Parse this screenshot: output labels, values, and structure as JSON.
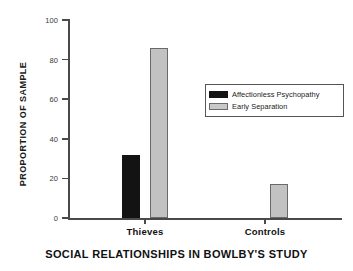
{
  "chart_data": {
    "type": "bar",
    "title": "SOCIAL RELATIONSHIPS IN BOWLBY'S STUDY",
    "xlabel": "",
    "ylabel": "PROPORTION OF SAMPLE",
    "categories": [
      "Thieves",
      "Controls"
    ],
    "series": [
      {
        "name": "Affectionless Psychopathy",
        "color": "#131313",
        "values": [
          32,
          0
        ]
      },
      {
        "name": "Early Separation",
        "color": "#c2c2c2",
        "values": [
          86,
          17
        ]
      }
    ],
    "ylim": [
      0,
      100
    ],
    "yticks": [
      0,
      20,
      40,
      60,
      80,
      100
    ],
    "ytick_labels": [
      "0",
      "20",
      "40",
      "60",
      "80",
      "100"
    ],
    "grid": false,
    "legend_position": "upper right"
  },
  "legend": {
    "items": [
      {
        "label": "Affectionless Psychopathy",
        "swatch": "dark-swatch"
      },
      {
        "label": "Early Separation",
        "swatch": "light-swatch"
      }
    ]
  },
  "colors": {
    "axis": "#4a4a4a",
    "dark_bar": "#131313",
    "light_bar": "#c2c2c2",
    "light_bar_border": "#6a6a6a",
    "text": "#1a1a1a",
    "background": "#ffffff"
  }
}
